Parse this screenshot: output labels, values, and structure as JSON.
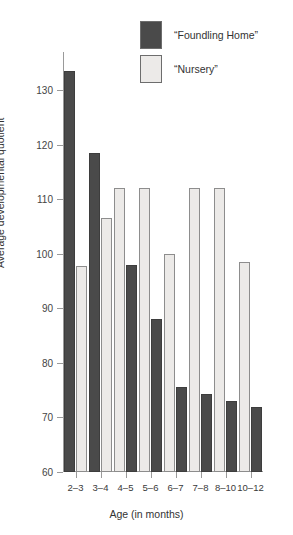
{
  "chart_data": {
    "type": "bar",
    "title": "",
    "xlabel": "Age (in months)",
    "ylabel": "Average developmental quotient",
    "categories": [
      "2–3",
      "3–4",
      "4–5",
      "5–6",
      "6–7",
      "7–8",
      "8–10",
      "10–12"
    ],
    "series": [
      {
        "name": "“Foundling Home”",
        "color": "#4a4a4a",
        "values": [
          133.5,
          118.5,
          98.0,
          88.0,
          75.5,
          74.3,
          73.0,
          72.0
        ]
      },
      {
        "name": "“Nursery”",
        "color": "#eceae8",
        "values": [
          97.7,
          106.5,
          112.0,
          112.0,
          100.0,
          112.0,
          112.0,
          98.5
        ]
      }
    ],
    "ylim": [
      60,
      137
    ],
    "yticks": [
      60,
      70,
      80,
      90,
      100,
      110,
      120,
      130
    ],
    "ytick_labels": [
      "60",
      "70",
      "80",
      "90",
      "100",
      "110",
      "120",
      "130"
    ],
    "grid": false,
    "legend_position": "top-right"
  },
  "legend": {
    "items": [
      {
        "label": "“Foundling Home”",
        "swatch": "dark"
      },
      {
        "label": "“Nursery”",
        "swatch": "light"
      }
    ]
  }
}
